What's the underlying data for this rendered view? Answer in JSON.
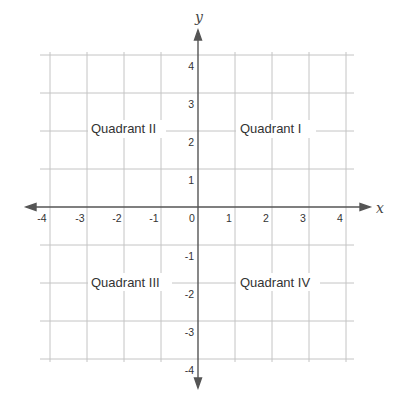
{
  "diagram": {
    "type": "coordinate_plane",
    "x_axis": {
      "label": "x",
      "min": -4,
      "max": 4,
      "ticks": [
        "-4",
        "-3",
        "-2",
        "-1",
        "0",
        "1",
        "2",
        "3",
        "4"
      ]
    },
    "y_axis": {
      "label": "y",
      "min": -4,
      "max": 4,
      "ticks": [
        "4",
        "3",
        "2",
        "1",
        "-1",
        "-2",
        "-3",
        "-4"
      ]
    },
    "quadrants": {
      "q1": "Quadrant I",
      "q2": "Quadrant II",
      "q3": "Quadrant III",
      "q4": "Quadrant IV"
    },
    "colors": {
      "grid": "#bdbdbd",
      "axis": "#555555",
      "text": "#333333"
    }
  }
}
